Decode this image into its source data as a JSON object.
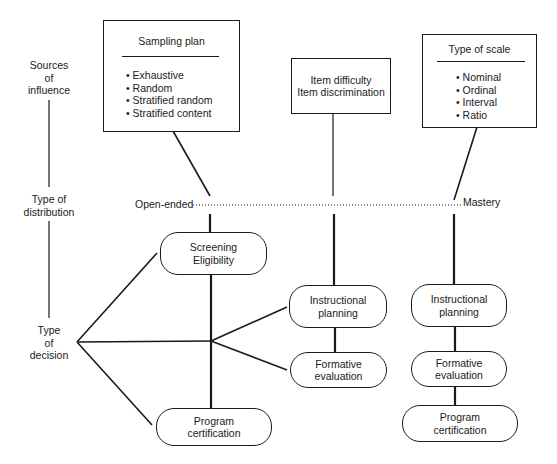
{
  "row_labels": {
    "sources": "Sources\nof\ninfluence",
    "distribution": "Type of\ndistribution",
    "decision": "Type\nof\ndecision"
  },
  "sources": {
    "sampling_plan": {
      "title": "Sampling plan",
      "items": [
        "Exhaustive",
        "Random",
        "Stratified random",
        "Stratified content"
      ]
    },
    "item_analysis": {
      "lines": [
        "Item difficulty",
        "Item discrimination"
      ]
    },
    "scale": {
      "title": "Type of scale",
      "items": [
        "Nominal",
        "Ordinal",
        "Interval",
        "Ratio"
      ]
    }
  },
  "distribution": {
    "left_end": "Open-ended",
    "right_end": "Mastery"
  },
  "decisions": {
    "open_ended": {
      "screening": "Screening\nEligibility",
      "certification": "Program\ncertification"
    },
    "middle": {
      "instructional": "Instructional\nplanning",
      "formative": "Formative\nevaluation"
    },
    "mastery": {
      "instructional": "Instructional\nplanning",
      "formative": "Formative\nevaluation",
      "certification": "Program\ncertification"
    }
  }
}
